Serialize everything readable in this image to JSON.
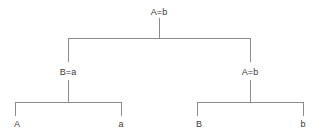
{
  "diagram": {
    "type": "binary-derivation-tree",
    "line_color": "#8c8c8c",
    "text_color": "#3a3a3a",
    "background_color": "#ffffff",
    "root": {
      "label": "A=b",
      "x": 159,
      "y": 13
    },
    "internal_nodes": [
      {
        "id": "left-internal",
        "label": "B=a",
        "x": 68,
        "y": 74
      },
      {
        "id": "right-internal",
        "label": "A=b",
        "x": 250,
        "y": 74
      }
    ],
    "leaves": [
      {
        "id": "leaf-1",
        "label": "A",
        "x": 16,
        "y": 128
      },
      {
        "id": "leaf-2",
        "label": "a",
        "x": 121,
        "y": 128
      },
      {
        "id": "leaf-3",
        "label": "B",
        "x": 198,
        "y": 128
      },
      {
        "id": "leaf-4",
        "label": "b",
        "x": 302,
        "y": 128
      }
    ]
  }
}
